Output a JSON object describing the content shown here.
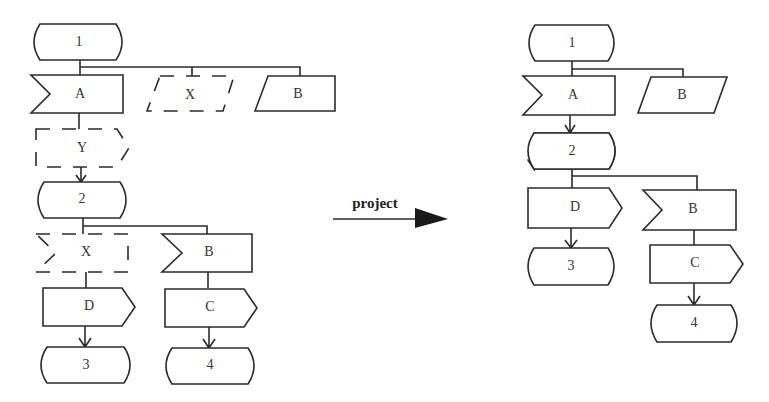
{
  "left": {
    "t1": "1",
    "A": "A",
    "X1": "X",
    "B1": "B",
    "Y": "Y",
    "t2": "2",
    "X2": "X",
    "B2": "B",
    "D": "D",
    "C": "C",
    "t3": "3",
    "t4": "4"
  },
  "arrow": {
    "label": "project"
  },
  "right": {
    "t1": "1",
    "A": "A",
    "B1": "B",
    "t2": "2",
    "D": "D",
    "B2": "B",
    "C": "C",
    "t3": "3",
    "t4": "4"
  },
  "colors": {
    "stroke": "#2b2b2b",
    "background": "#ffffff"
  }
}
